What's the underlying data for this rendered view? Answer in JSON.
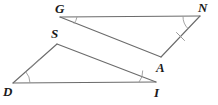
{
  "figure": {
    "type": "geometry-diagram",
    "background_color": "#ffffff",
    "stroke_color": "#6b6b6b",
    "label_color": "#1a1a1a",
    "width": 218,
    "height": 105
  },
  "triangles": [
    {
      "name": "triangle-GNA",
      "vertices": [
        "G",
        "N",
        "A"
      ],
      "points": {
        "G": [
          60,
          17
        ],
        "N": [
          200,
          16
        ],
        "A": [
          161,
          57
        ]
      }
    },
    {
      "name": "triangle-DSI",
      "vertices": [
        "S",
        "D",
        "I"
      ],
      "points": {
        "S": [
          57,
          44
        ],
        "D": [
          13,
          83
        ],
        "I": [
          156,
          82
        ]
      }
    }
  ],
  "labels": [
    {
      "text": "G",
      "name": "vertex-label-G",
      "x": 55,
      "y": 2
    },
    {
      "text": "N",
      "name": "vertex-label-N",
      "x": 198,
      "y": 1
    },
    {
      "text": "A",
      "name": "vertex-label-A",
      "x": 156,
      "y": 61
    },
    {
      "text": "S",
      "name": "vertex-label-S",
      "x": 51,
      "y": 27
    },
    {
      "text": "D",
      "name": "vertex-label-D",
      "x": 3,
      "y": 85
    },
    {
      "text": "I",
      "name": "vertex-label-I",
      "x": 154,
      "y": 86
    }
  ],
  "angle_marks": [
    {
      "name": "angle-arc-G",
      "vertex": "G"
    },
    {
      "name": "angle-arc-N",
      "vertex": "N"
    },
    {
      "name": "angle-arc-D",
      "vertex": "D"
    },
    {
      "name": "angle-arc-I",
      "vertex": "I"
    }
  ],
  "tick_marks": [
    {
      "name": "tick-mark-segment-NA",
      "segment": "NA",
      "count": 1
    },
    {
      "name": "tick-mark-segment-DS",
      "segment": "DS",
      "count": 1
    }
  ]
}
